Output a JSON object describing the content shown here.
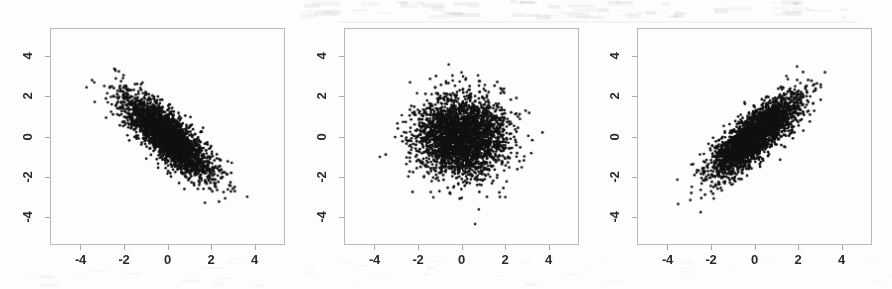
{
  "figure": {
    "panel_count": 3,
    "point_color": "#111111",
    "frame_color": "#b9b9b9",
    "background_color": "#fdfdfc",
    "tick_label_color": "#2a2a2a"
  },
  "axis": {
    "tick_values": [
      -4,
      -2,
      0,
      2,
      4
    ],
    "tick_labels": [
      "-4",
      "-2",
      "0",
      "2",
      "4"
    ],
    "xlim": [
      -5.4,
      5.4
    ],
    "ylim": [
      -5.4,
      5.4
    ]
  },
  "chart_data": [
    {
      "type": "scatter",
      "title": "",
      "xlabel": "",
      "ylabel": "",
      "panel_index": 1,
      "correlation": -0.8,
      "n_points": 3000,
      "mean_x": 0,
      "mean_y": 0,
      "sd_x": 1,
      "sd_y": 1,
      "xlim": [
        -5.4,
        5.4
      ],
      "ylim": [
        -5.4,
        5.4
      ],
      "xticks": [
        -4,
        -2,
        0,
        2,
        4
      ],
      "yticks": [
        -4,
        -2,
        0,
        2,
        4
      ],
      "xticklabels": [
        "-4",
        "-2",
        "0",
        "2",
        "4"
      ],
      "yticklabels": [
        "-4",
        "-2",
        "0",
        "2",
        "4"
      ],
      "grid": false,
      "legend": false,
      "marker": "filled-circle",
      "marker_size_px": 2,
      "color": "#111111",
      "seed": 10101,
      "observed_x_range": [
        -3.6,
        3.6
      ],
      "observed_y_range": [
        -3.6,
        3.9
      ],
      "description": "strong negative linear association, downward-sloping elliptical cloud"
    },
    {
      "type": "scatter",
      "title": "",
      "xlabel": "",
      "ylabel": "",
      "panel_index": 2,
      "correlation": 0.0,
      "n_points": 3000,
      "mean_x": 0,
      "mean_y": 0,
      "sd_x": 1,
      "sd_y": 1,
      "xlim": [
        -5.4,
        5.4
      ],
      "ylim": [
        -5.4,
        5.4
      ],
      "xticks": [
        -4,
        -2,
        0,
        2,
        4
      ],
      "yticks": [
        -4,
        -2,
        0,
        2,
        4
      ],
      "xticklabels": [
        "-4",
        "-2",
        "0",
        "2",
        "4"
      ],
      "yticklabels": [
        "-4",
        "-2",
        "0",
        "2",
        "4"
      ],
      "grid": false,
      "legend": false,
      "marker": "filled-circle",
      "marker_size_px": 2,
      "color": "#111111",
      "seed": 20202,
      "observed_x_range": [
        -3.3,
        3.7
      ],
      "observed_y_range": [
        -3.8,
        4.2
      ],
      "description": "no linear association, roughly circular isotropic cloud"
    },
    {
      "type": "scatter",
      "title": "",
      "xlabel": "",
      "ylabel": "",
      "panel_index": 3,
      "correlation": 0.8,
      "n_points": 3000,
      "mean_x": 0,
      "mean_y": 0,
      "sd_x": 1,
      "sd_y": 1,
      "xlim": [
        -5.4,
        5.4
      ],
      "ylim": [
        -5.4,
        5.4
      ],
      "xticks": [
        -4,
        -2,
        0,
        2,
        4
      ],
      "yticks": [
        -4,
        -2,
        0,
        2,
        4
      ],
      "xticklabels": [
        "-4",
        "-2",
        "0",
        "2",
        "4"
      ],
      "yticklabels": [
        "-4",
        "-2",
        "0",
        "2",
        "4"
      ],
      "grid": false,
      "legend": false,
      "marker": "filled-circle",
      "marker_size_px": 2,
      "color": "#111111",
      "seed": 30303,
      "observed_x_range": [
        -4.0,
        4.0
      ],
      "observed_y_range": [
        -3.5,
        4.4
      ],
      "description": "strong positive linear association, upward-sloping elliptical cloud"
    }
  ]
}
